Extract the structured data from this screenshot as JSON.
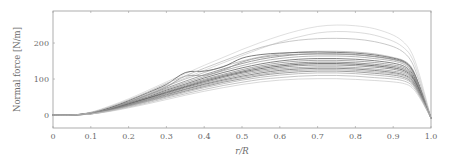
{
  "chart_data": {
    "type": "line",
    "title": "",
    "xlabel": "r/R",
    "ylabel": "Normal force [N/m]",
    "xlim": [
      0,
      1.0
    ],
    "ylim": [
      -36,
      289
    ],
    "xticks": [
      0,
      0.1,
      0.2,
      0.3,
      0.4,
      0.5,
      0.6,
      0.7,
      0.8,
      0.9,
      1.0
    ],
    "xtick_labels": [
      "0",
      "0.1",
      "0.2",
      "0.3",
      "0.4",
      "0.5",
      "0.6",
      "0.7",
      "0.8",
      "0.9",
      "1.0"
    ],
    "yticks": [
      0,
      100,
      200
    ],
    "ytick_labels": [
      "0",
      "100",
      "200"
    ],
    "grid": false,
    "legend": null,
    "x": [
      0,
      0.05,
      0.1,
      0.15,
      0.2,
      0.25,
      0.3,
      0.35,
      0.4,
      0.45,
      0.5,
      0.55,
      0.6,
      0.65,
      0.7,
      0.75,
      0.8,
      0.85,
      0.9,
      0.93,
      0.95,
      0.97,
      1.0
    ],
    "series": [
      {
        "name": "run-01",
        "shade": 0.92,
        "values": [
          0,
          0,
          8,
          25,
          45,
          68,
          92,
          115,
          138,
          160,
          182,
          202,
          220,
          235,
          246,
          250,
          248,
          240,
          222,
          200,
          170,
          110,
          -8
        ]
      },
      {
        "name": "run-02",
        "shade": 0.88,
        "values": [
          0,
          0,
          7,
          22,
          40,
          60,
          82,
          103,
          124,
          145,
          165,
          185,
          203,
          217,
          228,
          232,
          230,
          222,
          205,
          185,
          158,
          100,
          -8
        ]
      },
      {
        "name": "run-03",
        "shade": 0.8,
        "values": [
          0,
          0,
          6,
          20,
          38,
          58,
          80,
          100,
          118,
          135,
          150,
          162,
          170,
          175,
          177,
          177,
          175,
          170,
          160,
          150,
          130,
          80,
          -8
        ]
      },
      {
        "name": "run-04",
        "shade": 0.55,
        "values": [
          0,
          0,
          6,
          19,
          36,
          55,
          75,
          94,
          112,
          128,
          143,
          155,
          163,
          168,
          170,
          170,
          168,
          163,
          155,
          146,
          125,
          78,
          -8
        ]
      },
      {
        "name": "run-05",
        "shade": 0.7,
        "values": [
          0,
          0,
          5,
          18,
          35,
          53,
          72,
          90,
          107,
          123,
          137,
          149,
          157,
          162,
          164,
          164,
          162,
          157,
          150,
          140,
          120,
          75,
          -8
        ]
      },
      {
        "name": "run-06",
        "shade": 0.35,
        "values": [
          0,
          0,
          5,
          17,
          33,
          50,
          69,
          86,
          103,
          118,
          131,
          142,
          150,
          155,
          157,
          157,
          155,
          151,
          144,
          135,
          116,
          72,
          -8
        ]
      },
      {
        "name": "run-07",
        "shade": 0.6,
        "values": [
          0,
          0,
          5,
          16,
          32,
          48,
          66,
          83,
          99,
          113,
          126,
          137,
          145,
          150,
          152,
          152,
          150,
          146,
          139,
          131,
          112,
          70,
          -8
        ]
      },
      {
        "name": "run-08",
        "shade": 0.45,
        "values": [
          0,
          0,
          5,
          16,
          31,
          47,
          64,
          80,
          96,
          110,
          122,
          133,
          140,
          145,
          147,
          147,
          145,
          141,
          135,
          127,
          109,
          68,
          -8
        ]
      },
      {
        "name": "run-09",
        "shade": 0.25,
        "values": [
          0,
          0,
          4,
          15,
          30,
          46,
          62,
          78,
          93,
          107,
          119,
          129,
          136,
          141,
          143,
          143,
          141,
          137,
          131,
          123,
          106,
          66,
          -8
        ]
      },
      {
        "name": "run-10",
        "shade": 0.5,
        "values": [
          0,
          0,
          4,
          15,
          29,
          44,
          60,
          76,
          90,
          104,
          116,
          125,
          132,
          137,
          139,
          139,
          137,
          133,
          127,
          119,
          103,
          64,
          -8
        ]
      },
      {
        "name": "run-11",
        "shade": 0.65,
        "values": [
          0,
          0,
          4,
          14,
          28,
          43,
          58,
          73,
          87,
          100,
          112,
          121,
          128,
          132,
          134,
          134,
          132,
          128,
          122,
          115,
          99,
          62,
          -8
        ]
      },
      {
        "name": "run-12",
        "shade": 0.4,
        "values": [
          0,
          0,
          4,
          14,
          27,
          41,
          56,
          71,
          85,
          97,
          108,
          117,
          124,
          128,
          130,
          130,
          128,
          124,
          118,
          111,
          96,
          60,
          -8
        ]
      },
      {
        "name": "run-13",
        "shade": 0.72,
        "values": [
          0,
          0,
          4,
          13,
          26,
          40,
          54,
          68,
          82,
          94,
          105,
          113,
          120,
          124,
          126,
          126,
          124,
          120,
          115,
          108,
          93,
          58,
          -8
        ]
      },
      {
        "name": "run-14",
        "shade": 0.55,
        "values": [
          0,
          0,
          3,
          13,
          25,
          38,
          52,
          66,
          79,
          91,
          101,
          110,
          116,
          120,
          122,
          122,
          120,
          116,
          111,
          104,
          90,
          56,
          -8
        ]
      },
      {
        "name": "run-15",
        "shade": 0.78,
        "values": [
          0,
          0,
          3,
          12,
          24,
          37,
          50,
          63,
          76,
          87,
          97,
          105,
          111,
          115,
          117,
          117,
          115,
          111,
          106,
          100,
          87,
          54,
          -8
        ]
      },
      {
        "name": "run-16",
        "shade": 0.82,
        "values": [
          0,
          0,
          3,
          11,
          22,
          34,
          47,
          59,
          71,
          82,
          91,
          99,
          104,
          108,
          110,
          110,
          108,
          104,
          100,
          94,
          82,
          52,
          -8
        ]
      },
      {
        "name": "run-17",
        "shade": 0.86,
        "values": [
          0,
          0,
          3,
          10,
          20,
          31,
          43,
          55,
          66,
          76,
          85,
          92,
          97,
          100,
          101,
          101,
          99,
          96,
          92,
          87,
          76,
          48,
          -8
        ]
      },
      {
        "name": "run-18",
        "shade": 0.3,
        "values": [
          0,
          0,
          6,
          20,
          40,
          62,
          85,
          118,
          122,
          134,
          158,
          168,
          172,
          174,
          175,
          174,
          172,
          167,
          158,
          148,
          127,
          79,
          -8
        ]
      },
      {
        "name": "run-19",
        "shade": 0.62,
        "values": [
          0,
          0,
          5,
          18,
          36,
          56,
          78,
          108,
          110,
          125,
          147,
          160,
          166,
          169,
          170,
          169,
          167,
          162,
          154,
          144,
          124,
          77,
          -8
        ]
      },
      {
        "name": "run-20",
        "shade": 0.84,
        "values": [
          0,
          0,
          7,
          23,
          42,
          64,
          88,
          109,
          130,
          150,
          170,
          188,
          200,
          208,
          212,
          213,
          211,
          204,
          190,
          172,
          145,
          90,
          -8
        ]
      }
    ]
  }
}
